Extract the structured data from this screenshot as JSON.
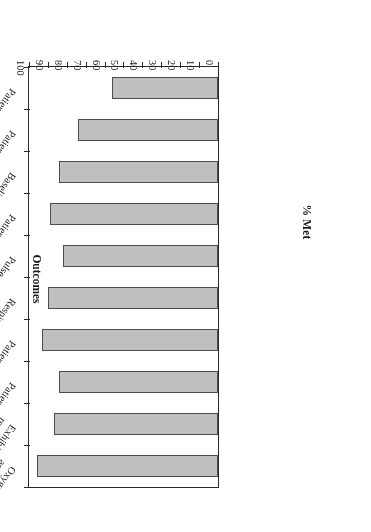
{
  "chart_data": {
    "type": "bar",
    "orientation": "horizontal",
    "title": "",
    "xlabel": "Outcomes",
    "ylabel": "% Met",
    "ylim": [
      0,
      100
    ],
    "ytick_step": 10,
    "yticks": [
      0,
      10,
      20,
      30,
      40,
      50,
      60,
      70,
      80,
      90,
      100
    ],
    "ytick_labels": [
      "0",
      "10",
      "20",
      "30",
      "40",
      "50",
      "60",
      "70",
      "80",
      "90",
      "100"
    ],
    "grid": false,
    "legend": false,
    "bar_fill_color": "#bfbfbf",
    "bar_edge_color": "#4d4d4d",
    "categories": [
      "Oxygenation assessment",
      "Exhibits decreased respiratory effort",
      "Patient is afebrile",
      "Patient can take oral medication",
      "Respiratory rate < 24",
      "Pulse oximetry > 90 or PO2 > 60 mm",
      "Patient pulse < 100",
      "Baseline mental status",
      "Patient safely increases activity level",
      "Patient verbalizes discharge instructions"
    ],
    "category_lines": [
      [
        "Oxygenation",
        "assessment"
      ],
      [
        "Exhibits decreased",
        "respiratory effort"
      ],
      [
        "Patient is afebrile",
        ""
      ],
      [
        "Patient can take oral medication",
        ""
      ],
      [
        "Respiratory rate < 24",
        ""
      ],
      [
        "Pulse oximetry > 90 or PO₂ > 60 mm",
        ""
      ],
      [
        "Patient pulse < 100",
        ""
      ],
      [
        "Baseline mental status",
        ""
      ],
      [
        "Patient safely increases activity level",
        ""
      ],
      [
        "Patient verbalizes discharge instructions",
        ""
      ]
    ],
    "values": [
      96,
      87,
      84,
      93,
      90,
      82,
      89,
      84,
      74,
      56
    ]
  },
  "figure": {
    "value_axis_title": "% Met",
    "category_axis_title": "Outcomes",
    "rotation_note": "180"
  }
}
